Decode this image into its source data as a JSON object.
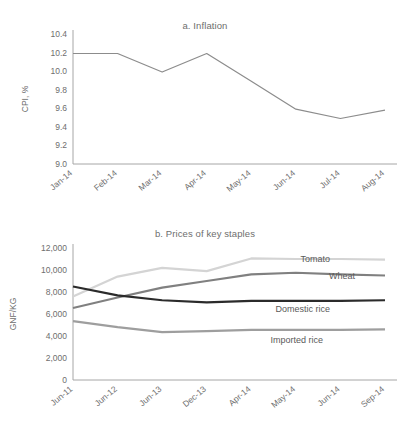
{
  "figure": {
    "background": "#ffffff",
    "text_color": "#6e6e6e"
  },
  "panel_a": {
    "title": "a. Inflation",
    "ylabel": "CPI, %"
  },
  "panel_b": {
    "title": "b. Prices of key staples",
    "ylabel": "GNF/KG"
  },
  "labels": {
    "tomato": "Tomato",
    "wheat": "Wheat",
    "domestic_rice": "Domestic rice",
    "imported_rice": "Imported rice"
  },
  "chart_data": [
    {
      "type": "line",
      "title": "a. Inflation",
      "xlabel": "",
      "ylabel": "CPI, %",
      "categories": [
        "Jan-14",
        "Feb-14",
        "Mar-14",
        "Apr-14",
        "May-14",
        "Jun-14",
        "Jul-14",
        "Aug-14"
      ],
      "ylim": [
        9.0,
        10.4
      ],
      "yticks": [
        "9.0",
        "9.2",
        "9.4",
        "9.6",
        "9.8",
        "10.0",
        "10.2",
        "10.4"
      ],
      "ytick_values": [
        9.0,
        9.2,
        9.4,
        9.6,
        9.8,
        10.0,
        10.2,
        10.4
      ],
      "grid": false,
      "legend": "none",
      "series": [
        {
          "name": "CPI",
          "color": "#8c8c8c",
          "width": 1.2,
          "values": [
            10.19,
            10.19,
            9.99,
            10.19,
            9.89,
            9.59,
            9.49,
            9.58
          ]
        }
      ]
    },
    {
      "type": "line",
      "title": "b. Prices of key staples",
      "xlabel": "",
      "ylabel": "GNF/KG",
      "categories": [
        "Jun-11",
        "Jun-12",
        "Jun-13",
        "Dec-13",
        "Apr-14",
        "May-14",
        "Jun-14",
        "Sep-14"
      ],
      "ylim": [
        0,
        12000
      ],
      "yticks": [
        "0",
        "2,000",
        "4,000",
        "6,000",
        "8,000",
        "10,000",
        "12,000"
      ],
      "ytick_values": [
        0,
        2000,
        4000,
        6000,
        8000,
        10000,
        12000
      ],
      "grid": false,
      "legend": "inline-right",
      "series": [
        {
          "name": "Tomato",
          "color": "#d4d4d4",
          "width": 2.2,
          "values": [
            7600,
            9400,
            10200,
            9900,
            11050,
            11000,
            11000,
            10950
          ]
        },
        {
          "name": "Wheat",
          "color": "#808080",
          "width": 2.2,
          "values": [
            6550,
            7500,
            8400,
            9000,
            9600,
            9750,
            9600,
            9500
          ]
        },
        {
          "name": "Domestic rice",
          "color": "#2b2b2b",
          "width": 2.2,
          "values": [
            8500,
            7700,
            7250,
            7050,
            7200,
            7200,
            7200,
            7250
          ]
        },
        {
          "name": "Imported rice",
          "color": "#9e9e9e",
          "width": 2.2,
          "values": [
            5350,
            4800,
            4350,
            4450,
            4550,
            4550,
            4550,
            4600
          ]
        }
      ]
    }
  ]
}
